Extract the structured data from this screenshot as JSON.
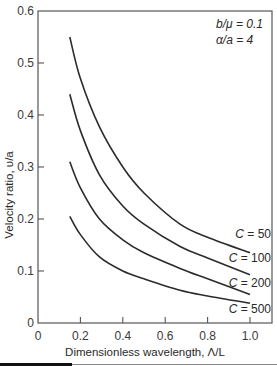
{
  "chart_data": {
    "type": "line",
    "title": "",
    "xlabel": "Dimensionless wavelength, Λ/L",
    "ylabel": "Velocity ratio, υ/a",
    "xlim": [
      0,
      1.1
    ],
    "ylim": [
      0,
      0.6
    ],
    "xticks": [
      0,
      0.2,
      0.4,
      0.6,
      0.8,
      1.0
    ],
    "xtick_labels": [
      "0",
      "0.2",
      "0.4",
      "0.6",
      "0.8",
      "1.0"
    ],
    "yticks": [
      0,
      0.1,
      0.2,
      0.3,
      0.4,
      0.5,
      0.6
    ],
    "ytick_labels": [
      "0",
      "0.1",
      "0.2",
      "0.3",
      "0.4",
      "0.5",
      "0.6"
    ],
    "grid": false,
    "annotations": [
      "b/μ = 0.1",
      "α/a = 4"
    ],
    "x": [
      0.15,
      0.2,
      0.29,
      0.4,
      0.5,
      0.67,
      0.8,
      1.0
    ],
    "series": [
      {
        "name": "C = 50",
        "label": "C = 50",
        "values": [
          0.55,
          0.47,
          0.377,
          0.3,
          0.25,
          0.19,
          0.165,
          0.135
        ]
      },
      {
        "name": "C = 100",
        "label": "C = 100",
        "values": [
          0.44,
          0.37,
          0.285,
          0.225,
          0.19,
          0.147,
          0.125,
          0.093
        ]
      },
      {
        "name": "C = 200",
        "label": "C = 200",
        "values": [
          0.31,
          0.26,
          0.2,
          0.16,
          0.135,
          0.105,
          0.085,
          0.055
        ]
      },
      {
        "name": "C = 500",
        "label": "C = 500",
        "values": [
          0.205,
          0.17,
          0.127,
          0.1,
          0.085,
          0.063,
          0.052,
          0.038
        ]
      }
    ]
  }
}
